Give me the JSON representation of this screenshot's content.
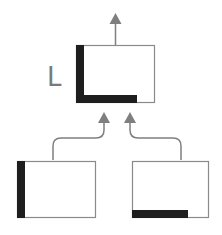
{
  "diagram": {
    "title": "",
    "result_label": "L",
    "colors": {
      "outline": "#8a8a8a",
      "fill_dark": "#1e1e1e",
      "arrow": "#7f7f7f",
      "label": "#7a7a7a",
      "background": "#ffffff"
    },
    "nodes": [
      {
        "id": "top",
        "description": "Combined shape: left bar + bottom bar forming L",
        "parts": [
          "left-bar",
          "bottom-bar"
        ]
      },
      {
        "id": "bottom-left",
        "description": "Box with left vertical bar",
        "parts": [
          "left-bar"
        ]
      },
      {
        "id": "bottom-right",
        "description": "Box with bottom horizontal bar",
        "parts": [
          "bottom-bar"
        ]
      }
    ],
    "edges": [
      {
        "from": "bottom-left",
        "to": "top"
      },
      {
        "from": "bottom-right",
        "to": "top"
      },
      {
        "from": "top",
        "to": "output"
      }
    ]
  }
}
